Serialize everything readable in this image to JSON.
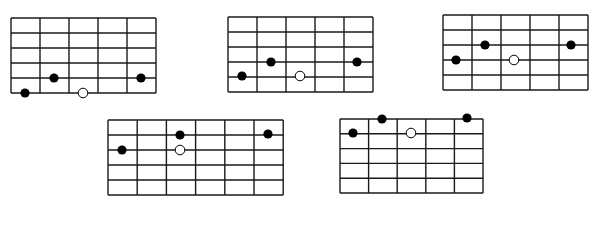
{
  "figure": {
    "line_color": "#1a1a1a",
    "filled_dot_color": "#000000",
    "open_dot_fill": "#ffffff",
    "diagrams": [
      {
        "id": "diagram-1",
        "x": 11,
        "y": 18,
        "cols": 5,
        "rows": 5,
        "cell_w": 29,
        "cell_h": 15,
        "dots": [
          {
            "x": 25,
            "y": 93,
            "type": "filled"
          },
          {
            "x": 54,
            "y": 78,
            "type": "filled"
          },
          {
            "x": 83,
            "y": 93,
            "type": "open"
          },
          {
            "x": 141,
            "y": 78,
            "type": "filled"
          }
        ]
      },
      {
        "id": "diagram-2",
        "x": 228,
        "y": 17,
        "cols": 5,
        "rows": 5,
        "cell_w": 29,
        "cell_h": 15,
        "dots": [
          {
            "x": 242,
            "y": 76,
            "type": "filled"
          },
          {
            "x": 271,
            "y": 62,
            "type": "filled"
          },
          {
            "x": 300,
            "y": 76,
            "type": "open"
          },
          {
            "x": 357,
            "y": 62,
            "type": "filled"
          }
        ]
      },
      {
        "id": "diagram-3",
        "x": 443,
        "y": 15,
        "cols": 5,
        "rows": 5,
        "cell_w": 29,
        "cell_h": 15,
        "dots": [
          {
            "x": 456,
            "y": 60,
            "type": "filled"
          },
          {
            "x": 485,
            "y": 45,
            "type": "filled"
          },
          {
            "x": 514,
            "y": 60,
            "type": "open"
          },
          {
            "x": 571,
            "y": 45,
            "type": "filled"
          }
        ]
      },
      {
        "id": "diagram-4",
        "x": 108,
        "y": 120,
        "cols": 6,
        "rows": 5,
        "cell_w": 29.2,
        "cell_h": 15,
        "dots": [
          {
            "x": 122,
            "y": 150,
            "type": "filled"
          },
          {
            "x": 180,
            "y": 135,
            "type": "filled"
          },
          {
            "x": 180,
            "y": 150,
            "type": "open"
          },
          {
            "x": 268,
            "y": 134,
            "type": "filled"
          }
        ]
      },
      {
        "id": "diagram-5",
        "x": 340,
        "y": 119,
        "cols": 5,
        "rows": 5,
        "cell_w": 28.6,
        "cell_h": 14.8,
        "dots": [
          {
            "x": 353,
            "y": 133,
            "type": "filled"
          },
          {
            "x": 382,
            "y": 119,
            "type": "filled"
          },
          {
            "x": 411,
            "y": 133,
            "type": "open"
          },
          {
            "x": 467,
            "y": 118,
            "type": "filled"
          }
        ]
      }
    ]
  }
}
